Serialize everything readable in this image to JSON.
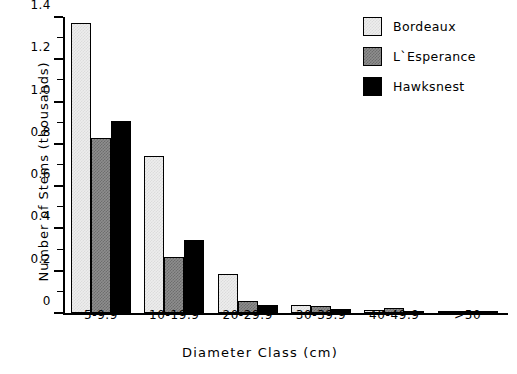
{
  "chart_data": {
    "type": "bar",
    "title": "",
    "subtitle": "",
    "xlabel": "Diameter Class (cm)",
    "ylabel": "Number of Stems (thousands)",
    "categories": [
      "5-9.9",
      "10-19.9",
      "20-29.9",
      "30-39.9",
      "40-49.9",
      ">50"
    ],
    "series": [
      {
        "name": "Bordeaux",
        "color": "#ededed",
        "values": [
          1.37,
          0.745,
          0.185,
          0.04,
          0.015,
          0.005
        ]
      },
      {
        "name": "L`Esperance",
        "color": "#8e8e8e",
        "values": [
          0.83,
          0.265,
          0.055,
          0.035,
          0.025,
          0.005
        ]
      },
      {
        "name": "Hawksnest",
        "color": "#000000",
        "values": [
          0.91,
          0.345,
          0.04,
          0.02,
          0.01,
          0.005
        ]
      }
    ],
    "ylim": [
      0,
      1.4
    ],
    "ytick_labels": [
      "0",
      "0.2",
      "0.4",
      "0.6",
      "0.8",
      "1.0",
      "1.2",
      "1.4"
    ],
    "ytick_values": [
      0,
      0.2,
      0.4,
      0.6,
      0.8,
      1.0,
      1.2,
      1.4
    ],
    "yminor_values": [
      0.1,
      0.3,
      0.5,
      0.7,
      0.9,
      1.1,
      1.3
    ],
    "grid": false,
    "legend_position": "top-right",
    "legend": [
      "Bordeaux",
      "L`Esperance",
      "Hawksnest"
    ]
  }
}
